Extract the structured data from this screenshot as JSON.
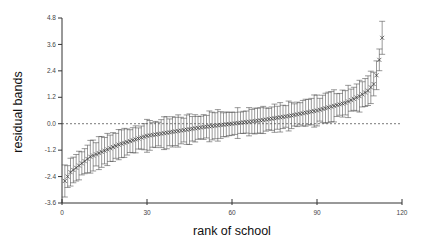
{
  "chart_data": {
    "type": "scatter",
    "title": "",
    "xlabel": "rank of school",
    "ylabel": "residual bands",
    "xlim": [
      0,
      120
    ],
    "ylim": [
      -3.6,
      4.8
    ],
    "xticks": [
      0,
      30,
      60,
      90,
      120
    ],
    "xtick_labels": [
      "0",
      "30",
      "60",
      "90",
      "120"
    ],
    "yticks": [
      -3.6,
      -2.4,
      -1.2,
      0.0,
      1.2,
      2.4,
      3.6,
      4.8
    ],
    "ytick_labels": [
      "-3.6",
      "-2.4",
      "-1.2",
      "0.0",
      "1.2",
      "2.4",
      "3.6",
      "4.8"
    ],
    "grid": false,
    "legend": null,
    "reference_line": {
      "y": 0.0,
      "style": "dashed"
    },
    "marker": "x",
    "error_bars": true,
    "series": [
      {
        "name": "residual",
        "n_points": 113,
        "x": [
          1,
          2,
          3,
          5,
          10,
          20,
          30,
          40,
          50,
          60,
          70,
          80,
          90,
          100,
          105,
          108,
          110,
          111,
          112,
          113
        ],
        "values": [
          -2.6,
          -2.4,
          -2.2,
          -2.0,
          -1.5,
          -0.95,
          -0.55,
          -0.35,
          -0.15,
          0.0,
          0.15,
          0.35,
          0.6,
          0.95,
          1.25,
          1.5,
          1.8,
          2.2,
          2.9,
          3.9
        ],
        "error_halfwidth_approx": 0.6
      }
    ]
  },
  "axes": {
    "x_title": "rank of school",
    "y_title": "residual bands"
  }
}
